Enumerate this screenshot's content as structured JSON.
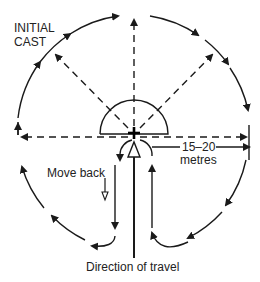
{
  "diagram": {
    "type": "retrieval casting pattern",
    "labels": {
      "initial_cast_line1": "INITIAL",
      "initial_cast_line2": "CAST",
      "distance_line1": "15–20",
      "distance_line2": "metres",
      "move_back": "Move back",
      "direction": "Direction of travel"
    },
    "colors": {
      "stroke": "#1a1a1a",
      "background": "#ffffff",
      "text": "#222222"
    },
    "elements": {
      "outer_circle": "dashed-arc clockwise arrows around handler",
      "radial_casts": [
        "left",
        "upper-left",
        "up",
        "upper-right",
        "right"
      ],
      "handler_marker": "cross at center",
      "direction_arrow": "hollow arrow pointing up"
    }
  }
}
